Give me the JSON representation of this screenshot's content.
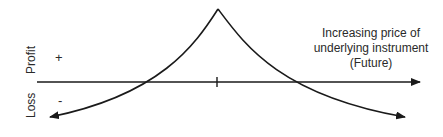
{
  "diagram": {
    "type": "payoff-diagram",
    "y_axis": {
      "upper_label": "Profit",
      "lower_label": "Loss",
      "plus_sign": "+",
      "minus_sign": "-"
    },
    "x_axis": {
      "description_line1": "Increasing price of",
      "description_line2": "underlying instrument",
      "description_line3": "(Future)"
    },
    "curve": {
      "shape": "inverted-V concave (short straddle-like payoff)",
      "peak_x_px": 218,
      "peak_y_px": 9,
      "left_zero_cross_x_px": 160,
      "right_zero_cross_x_px": 295
    },
    "colors": {
      "line": "#1a1a1a",
      "background": "#ffffff"
    }
  }
}
